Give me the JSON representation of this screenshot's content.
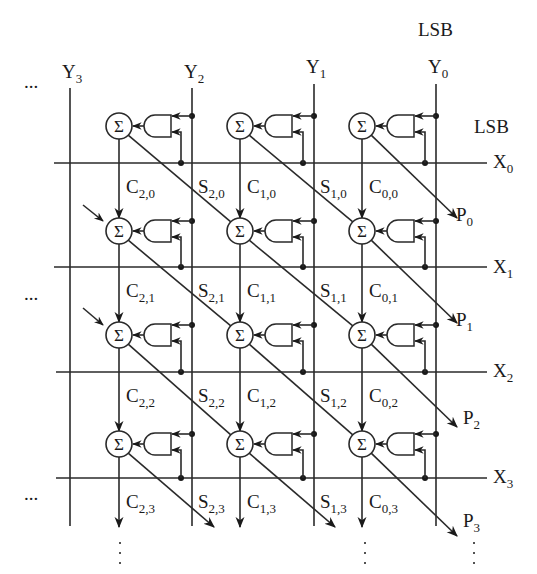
{
  "diagram": {
    "type": "array-multiplier",
    "colors": {
      "ink": "#1a1a1a",
      "background": "#ffffff"
    },
    "top_labels": {
      "lsb_y": "LSB",
      "lsb_x": "LSB"
    },
    "y_inputs": [
      {
        "base": "Y",
        "sub": "3"
      },
      {
        "base": "Y",
        "sub": "2"
      },
      {
        "base": "Y",
        "sub": "1"
      },
      {
        "base": "Y",
        "sub": "0"
      }
    ],
    "x_inputs": [
      {
        "base": "X",
        "sub": "0"
      },
      {
        "base": "X",
        "sub": "1"
      },
      {
        "base": "X",
        "sub": "2"
      },
      {
        "base": "X",
        "sub": "3"
      }
    ],
    "products": [
      {
        "base": "P",
        "sub": "0"
      },
      {
        "base": "P",
        "sub": "1"
      },
      {
        "base": "P",
        "sub": "2"
      },
      {
        "base": "P",
        "sub": "3"
      }
    ],
    "adder_symbol": "Σ",
    "ellipsis": "...",
    "carry_labels": [
      [
        {
          "base": "C",
          "sub": "2,0"
        },
        {
          "base": "C",
          "sub": "1,0"
        },
        {
          "base": "C",
          "sub": "0,0"
        }
      ],
      [
        {
          "base": "C",
          "sub": "2,1"
        },
        {
          "base": "C",
          "sub": "1,1"
        },
        {
          "base": "C",
          "sub": "0,1"
        }
      ],
      [
        {
          "base": "C",
          "sub": "2,2"
        },
        {
          "base": "C",
          "sub": "1,2"
        },
        {
          "base": "C",
          "sub": "0,2"
        }
      ],
      [
        {
          "base": "C",
          "sub": "2,3"
        },
        {
          "base": "C",
          "sub": "1,3"
        },
        {
          "base": "C",
          "sub": "0,3"
        }
      ]
    ],
    "sum_labels": [
      [
        {
          "base": "S",
          "sub": "2,0"
        },
        {
          "base": "S",
          "sub": "1,0"
        }
      ],
      [
        {
          "base": "S",
          "sub": "2,1"
        },
        {
          "base": "S",
          "sub": "1,1"
        }
      ],
      [
        {
          "base": "S",
          "sub": "2,2"
        },
        {
          "base": "S",
          "sub": "1,2"
        }
      ],
      [
        {
          "base": "S",
          "sub": "2,3"
        },
        {
          "base": "S",
          "sub": "1,3"
        }
      ]
    ]
  }
}
